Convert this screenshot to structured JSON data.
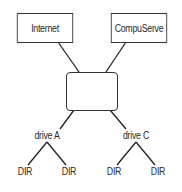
{
  "diagram": {
    "type": "network-tree",
    "top_nodes": [
      {
        "id": "internet",
        "label": "Internet"
      },
      {
        "id": "compuserve",
        "label": "CompuServe"
      }
    ],
    "hub": {
      "id": "hub",
      "label": ""
    },
    "drives": [
      {
        "id": "drive-a",
        "label": "drive A",
        "children": [
          "DIR",
          "DIR"
        ]
      },
      {
        "id": "drive-c",
        "label": "drive C",
        "children": [
          "DIR",
          "DIR"
        ]
      }
    ],
    "edges": [
      [
        "internet",
        "hub"
      ],
      [
        "compuserve",
        "hub"
      ],
      [
        "hub",
        "drive-a"
      ],
      [
        "hub",
        "drive-c"
      ],
      [
        "drive-a",
        "drive-a-dir-1"
      ],
      [
        "drive-a",
        "drive-a-dir-2"
      ],
      [
        "drive-c",
        "drive-c-dir-1"
      ],
      [
        "drive-c",
        "drive-c-dir-2"
      ]
    ],
    "colors": {
      "line": "#222222",
      "box_border": "#333333",
      "text": "#2a2a2a",
      "background": "#ffffff"
    }
  }
}
